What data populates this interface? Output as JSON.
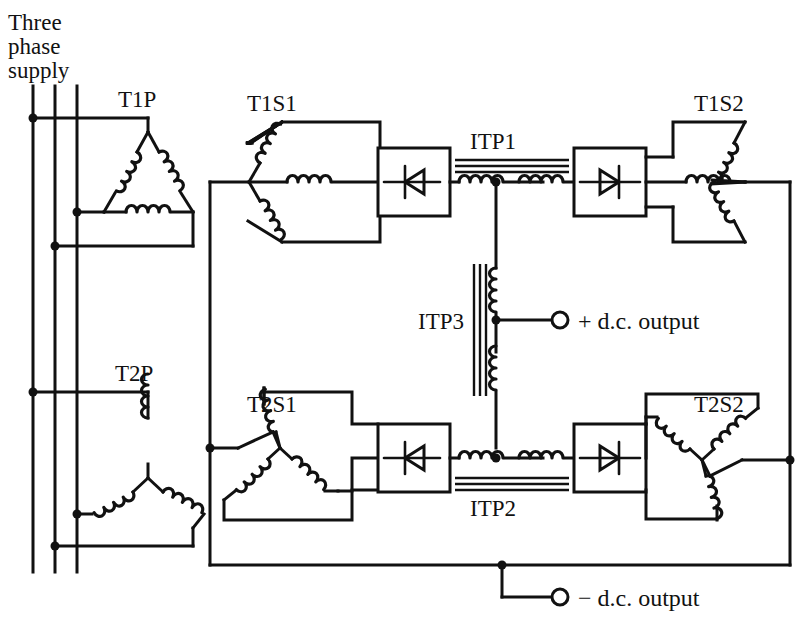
{
  "diagram": {
    "type": "electrical-schematic",
    "colors": {
      "line": "#111111",
      "background": "#ffffff"
    },
    "supply": {
      "label_line1": "Three",
      "label_line2": "phase",
      "label_line3": "supply",
      "phases": 3
    },
    "labels": {
      "t1p": "T1P",
      "t1s1": "T1S1",
      "t1s2": "T1S2",
      "t2p": "T2P",
      "t2s1": "T2S1",
      "t2s2": "T2S2",
      "itp1": "ITP1",
      "itp2": "ITP2",
      "itp3": "ITP3"
    },
    "outputs": {
      "positive": "+ d.c. output",
      "negative": "− d.c. output"
    },
    "components": {
      "transformers": [
        {
          "name": "T1P",
          "winding": "delta",
          "role": "primary"
        },
        {
          "name": "T2P",
          "winding": "star",
          "role": "primary"
        },
        {
          "name": "T1S1",
          "winding": "star",
          "role": "secondary"
        },
        {
          "name": "T1S2",
          "winding": "star",
          "role": "secondary"
        },
        {
          "name": "T2S1",
          "winding": "star",
          "role": "secondary"
        },
        {
          "name": "T2S2",
          "winding": "star",
          "role": "secondary"
        }
      ],
      "interphase_transformers": [
        {
          "name": "ITP1",
          "orientation": "horizontal",
          "core_position": "above"
        },
        {
          "name": "ITP2",
          "orientation": "horizontal",
          "core_position": "below"
        },
        {
          "name": "ITP3",
          "orientation": "vertical",
          "core_position": "left"
        }
      ],
      "rectifier_bridges": [
        {
          "id": "rect-top-left",
          "symbol": "diode"
        },
        {
          "id": "rect-top-right",
          "symbol": "diode"
        },
        {
          "id": "rect-bottom-left",
          "symbol": "diode"
        },
        {
          "id": "rect-bottom-right",
          "symbol": "diode"
        }
      ]
    }
  }
}
